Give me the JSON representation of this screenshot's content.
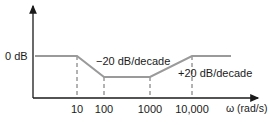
{
  "chart_data": {
    "type": "line",
    "title": "",
    "xlabel": "ω (rad/s)",
    "ylabel": "",
    "x_scale": "log",
    "x_ticks": [
      10,
      100,
      1000,
      10000
    ],
    "x_tick_labels": [
      "10",
      "100",
      "1000",
      "10,000"
    ],
    "y_tick_labels": [
      "0 dB"
    ],
    "series": [
      {
        "name": "Bode magnitude asymptote",
        "points": [
          {
            "x": 1,
            "y": 0
          },
          {
            "x": 10,
            "y": 0
          },
          {
            "x": 100,
            "y": -20
          },
          {
            "x": 1000,
            "y": -20
          },
          {
            "x": 10000,
            "y": 0
          },
          {
            "x": 40000,
            "y": 0
          }
        ]
      }
    ],
    "annotations": [
      {
        "text": "−20 dB/decade",
        "segment": "10 to 100"
      },
      {
        "text": "+20 dB/decade",
        "segment": "1000 to 10,000"
      }
    ],
    "grid": false,
    "legend": "none"
  }
}
